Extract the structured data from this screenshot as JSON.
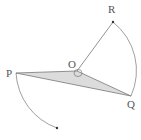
{
  "diagram": {
    "type": "geometry-rotation",
    "points": {
      "O": {
        "label": "O",
        "x": 77,
        "y": 71
      },
      "P": {
        "label": "P",
        "x": 16,
        "y": 73
      },
      "Q": {
        "label": "Q",
        "x": 131,
        "y": 96
      },
      "R": {
        "label": "R",
        "x": 113,
        "y": 22
      },
      "P_rotated": {
        "label": "",
        "x": 57,
        "y": 128
      }
    },
    "shaded_triangle": [
      "P",
      "O",
      "Q"
    ],
    "segments": [
      [
        "O",
        "R"
      ]
    ],
    "arcs": [
      {
        "from": "R",
        "to": "Q",
        "center": "O"
      },
      {
        "from": "P",
        "to": "P_rotated",
        "center": "O"
      }
    ],
    "angle_marker_at": "O",
    "colors": {
      "line": "#777777",
      "fill": "#d9d9d9",
      "point": "#333333"
    }
  }
}
